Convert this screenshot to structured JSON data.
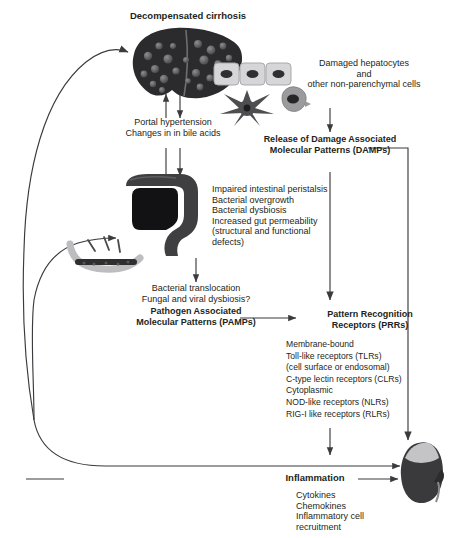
{
  "figure": {
    "type": "flow-diagram"
  },
  "nodes": {
    "cirrhosis_title": "Decompensated cirrhosis",
    "damaged_cells": "Damaged hepatocytes\nand\nother non-parenchymal cells",
    "portal": "Portal hypertension\nChanges in in bile acids",
    "damps": "Release of Damage Associated\nMolecular Patterns (DAMPs)",
    "gut_effects": "Impaired intestinal peristalsis\nBacterial overgrowth\nBacterial dysbiosis\nIncreased gut permeability\n(structural and functional\ndefects)",
    "translocation": "Bacterial translocation\nFungal and viral dysbiosis?",
    "pamps": "Pathogen Associated\nMolecular Patterns (PAMPs)",
    "prrs_title": "Pattern Recognition\nReceptors (PRRs)",
    "prrs_list": "Membrane-bound\n  Toll-like receptors (TLRs)\n      (cell surface or endosomal)\n  C-type lectin receptors (CLRs)\nCytoplasmic\n  NOD-like receptors (NLRs)\n  RIG-I like receptors (RLRs)",
    "inflammation": "Inflammation",
    "inflammation_list": "Cytokines\nChemokines\nInflammatory cell\nrecruitment"
  },
  "art": {
    "liver": "cirrhotic-liver-illustration",
    "hepatocytes": "hepatocyte-row-illustration",
    "stellate_cell": "stellate-cell-illustration",
    "kupffer_cell": "kupffer-cell-illustration",
    "colon": "colon-illustration",
    "gut_bacteria": "gut-bacteria-illustration",
    "kidney": "kidney-illustration"
  },
  "colors": {
    "stroke": "#3b3b3f",
    "text": "#231f20",
    "liver_dark": "#2b2b2d",
    "kidney_dark": "#3a3a3c",
    "cell_light": "#c9c9cb"
  }
}
